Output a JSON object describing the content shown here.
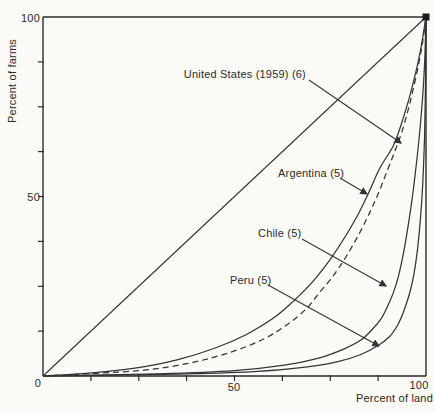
{
  "figure": {
    "background": "#fbfaf6",
    "ink": "#2b2b2b"
  },
  "chart_data": {
    "type": "line",
    "title": "",
    "xlabel": "Percent of land",
    "ylabel": "Percent of farms",
    "xlim": [
      0,
      100
    ],
    "ylim": [
      0,
      100
    ],
    "grid": false,
    "legend_position": "none",
    "origin_label": "0",
    "x_ticks": {
      "minor": [
        12.5,
        25,
        37.5,
        50,
        62.5,
        75,
        87.5
      ],
      "labeled": [
        {
          "value": 50,
          "label": "50"
        },
        {
          "value": 100,
          "label": "100"
        }
      ]
    },
    "y_ticks": {
      "minor": [
        12.5,
        25,
        37.5,
        50,
        62.5,
        75,
        87.5
      ],
      "labeled": [
        {
          "value": 50,
          "label": "50"
        },
        {
          "value": 100,
          "label": "100"
        }
      ]
    },
    "series": [
      {
        "id": "equality",
        "name": "line of equality",
        "style": "solid",
        "points": [
          [
            0,
            0
          ],
          [
            100,
            100
          ]
        ]
      },
      {
        "id": "us",
        "name": "United States (1959) (6)",
        "style": "dashed",
        "points": [
          [
            0,
            0
          ],
          [
            15,
            0.8
          ],
          [
            28,
            1.8
          ],
          [
            40,
            4
          ],
          [
            50,
            7
          ],
          [
            58,
            10.5
          ],
          [
            64,
            14.5
          ],
          [
            69,
            19
          ],
          [
            72,
            23
          ],
          [
            75.5,
            27.5
          ],
          [
            79,
            33
          ],
          [
            82.5,
            39.5
          ],
          [
            85.5,
            46
          ],
          [
            87.8,
            51.5
          ],
          [
            90,
            57.5
          ],
          [
            92,
            63
          ],
          [
            93.7,
            68
          ],
          [
            95.3,
            74
          ],
          [
            96.8,
            80.5
          ],
          [
            98.2,
            87.5
          ],
          [
            99.2,
            93.5
          ],
          [
            100,
            100
          ]
        ]
      },
      {
        "id": "argentina",
        "name": "Argentina (5)",
        "style": "solid",
        "points": [
          [
            0,
            0
          ],
          [
            12,
            0.8
          ],
          [
            24,
            2.2
          ],
          [
            35,
            4.5
          ],
          [
            45,
            7.8
          ],
          [
            53,
            11.5
          ],
          [
            60,
            16
          ],
          [
            64,
            19.5
          ],
          [
            67.5,
            23
          ],
          [
            71,
            27
          ],
          [
            75,
            32.5
          ],
          [
            79,
            39
          ],
          [
            82.5,
            45.5
          ],
          [
            85,
            51
          ],
          [
            88,
            58
          ],
          [
            91.4,
            64
          ],
          [
            93.5,
            70
          ],
          [
            95.5,
            77
          ],
          [
            97.3,
            84.5
          ],
          [
            98.7,
            91.5
          ],
          [
            100,
            100
          ]
        ]
      },
      {
        "id": "chile",
        "name": "Chile (5)",
        "style": "solid",
        "points": [
          [
            0,
            0
          ],
          [
            30,
            0.6
          ],
          [
            50,
            1.5
          ],
          [
            63,
            3
          ],
          [
            72,
            5
          ],
          [
            78.5,
            7.5
          ],
          [
            83,
            10
          ],
          [
            86,
            13
          ],
          [
            88.3,
            16
          ],
          [
            90,
            19.5
          ],
          [
            91.4,
            23
          ],
          [
            92.6,
            27
          ],
          [
            93.6,
            31.5
          ],
          [
            94.6,
            37
          ],
          [
            95.5,
            43
          ],
          [
            96.4,
            49.5
          ],
          [
            97.2,
            56.5
          ],
          [
            98,
            64
          ],
          [
            98.7,
            72
          ],
          [
            99.3,
            80.5
          ],
          [
            99.7,
            89
          ],
          [
            100,
            100
          ]
        ]
      },
      {
        "id": "peru",
        "name": "Peru (5)",
        "style": "solid",
        "points": [
          [
            0,
            0
          ],
          [
            35,
            0.5
          ],
          [
            55,
            1.2
          ],
          [
            68,
            2.4
          ],
          [
            77,
            4
          ],
          [
            83,
            6
          ],
          [
            87.5,
            8.5
          ],
          [
            90.5,
            11
          ],
          [
            92.5,
            14
          ],
          [
            94,
            17.5
          ],
          [
            95.3,
            21.5
          ],
          [
            96.3,
            25.5
          ],
          [
            97.1,
            30
          ],
          [
            97.8,
            35.5
          ],
          [
            98.4,
            42
          ],
          [
            98.9,
            49
          ],
          [
            99.3,
            57
          ],
          [
            99.6,
            66
          ],
          [
            99.8,
            76
          ],
          [
            99.95,
            87
          ],
          [
            100,
            100
          ]
        ]
      }
    ],
    "annotations": [
      {
        "id": "us",
        "label": "United States (1959) (6)",
        "text_anchor": "end",
        "label_px": [
          306,
          78
        ],
        "arrow_from_px": [
          309,
          80
        ],
        "arrow_to_px": [
          401,
          143
        ]
      },
      {
        "id": "argentina",
        "label": "Argentina (5)",
        "text_anchor": "start",
        "label_px": [
          278,
          177
        ],
        "arrow_from_px": [
          340,
          178
        ],
        "arrow_to_px": [
          367,
          194
        ]
      },
      {
        "id": "chile",
        "label": "Chile (5)",
        "text_anchor": "start",
        "label_px": [
          258,
          237
        ],
        "arrow_from_px": [
          302,
          239
        ],
        "arrow_to_px": [
          386,
          286
        ]
      },
      {
        "id": "peru",
        "label": "Peru (5)",
        "text_anchor": "start",
        "label_px": [
          230,
          284
        ],
        "arrow_from_px": [
          268,
          285
        ],
        "arrow_to_px": [
          379,
          346
        ]
      }
    ],
    "corner_marker_at": [
      100,
      100
    ]
  }
}
